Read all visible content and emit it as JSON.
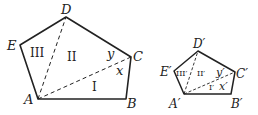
{
  "figures": [
    {
      "name": "pentagon-large",
      "vertices": {
        "A": {
          "label": "A",
          "x": 38,
          "y": 99
        },
        "B": {
          "label": "B",
          "x": 126,
          "y": 99
        },
        "C": {
          "label": "C",
          "x": 131,
          "y": 57
        },
        "D": {
          "label": "D",
          "x": 66,
          "y": 17
        },
        "E": {
          "label": "E",
          "x": 20,
          "y": 45
        }
      },
      "regions": {
        "r1": "I",
        "r2": "II",
        "r3": "III"
      },
      "angles": {
        "x": "x",
        "y": "y"
      }
    },
    {
      "name": "pentagon-small",
      "vertices": {
        "A": {
          "label": "A′",
          "x": 184,
          "y": 94
        },
        "B": {
          "label": "B′",
          "x": 231,
          "y": 94
        },
        "C": {
          "label": "C′",
          "x": 235,
          "y": 72
        },
        "D": {
          "label": "D′",
          "x": 198,
          "y": 51
        },
        "E": {
          "label": "E′",
          "x": 174,
          "y": 71
        }
      },
      "regions": {
        "r1": "I′",
        "r2": "II′",
        "r3": "III′"
      },
      "angles": {
        "x": "x′",
        "y": "y′"
      }
    }
  ],
  "colors": {
    "stroke": "#222222",
    "background": "#ffffff"
  }
}
